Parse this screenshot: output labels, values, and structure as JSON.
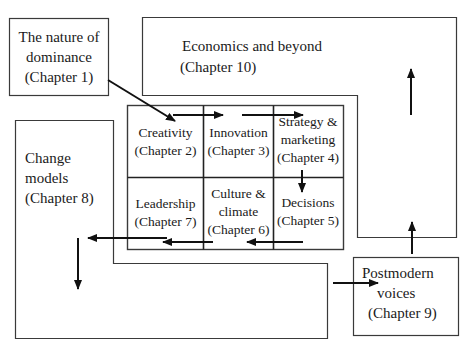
{
  "diagram": {
    "type": "chapter-flow-diagram",
    "nodes": [
      {
        "id": "ch1",
        "title_lines": [
          "The nature of",
          "dominance",
          "(Chapter 1)"
        ]
      },
      {
        "id": "ch2",
        "title_lines": [
          "Creativity",
          "(Chapter 2)"
        ]
      },
      {
        "id": "ch3",
        "title_lines": [
          "Innovation",
          "(Chapter 3)"
        ]
      },
      {
        "id": "ch4",
        "title_lines": [
          "Strategy &",
          "marketing",
          "(Chapter 4)"
        ]
      },
      {
        "id": "ch5",
        "title_lines": [
          "Decisions",
          "(Chapter 5)"
        ]
      },
      {
        "id": "ch6",
        "title_lines": [
          "Culture &",
          "climate",
          "(Chapter 6)"
        ]
      },
      {
        "id": "ch7",
        "title_lines": [
          "Leadership",
          "(Chapter 7)"
        ]
      },
      {
        "id": "ch8",
        "title_lines": [
          "Change",
          "models",
          "(Chapter 8)"
        ]
      },
      {
        "id": "ch9",
        "title_lines": [
          "Postmodern",
          "voices",
          "(Chapter 9)"
        ]
      },
      {
        "id": "ch10",
        "title_lines": [
          "Economics and beyond",
          "(Chapter 10)"
        ]
      }
    ],
    "edges": [
      {
        "from": "ch1",
        "to": "ch2"
      },
      {
        "from": "ch2",
        "to": "ch3"
      },
      {
        "from": "ch3",
        "to": "ch4"
      },
      {
        "from": "ch4",
        "to": "ch5"
      },
      {
        "from": "ch5",
        "to": "ch6"
      },
      {
        "from": "ch6",
        "to": "ch7"
      },
      {
        "from": "ch7",
        "to": "ch8"
      },
      {
        "from": "ch8",
        "to": "ch9"
      },
      {
        "from": "ch9",
        "to": "ch10"
      }
    ],
    "colors": {
      "stroke": "#3a3a3a",
      "arrow": "#111111",
      "background": "#ffffff",
      "text": "#1a1a1a"
    }
  }
}
